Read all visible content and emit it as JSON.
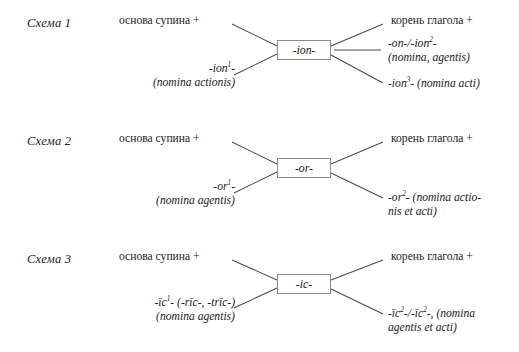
{
  "document": {
    "type": "linguistic-derivation-diagrams",
    "language": "ru",
    "scheme_count": 3
  },
  "schemes": [
    {
      "label": "Схема 1",
      "center_box": "-ion-",
      "top_left": "основа супина +",
      "bottom_left_line1": "-ion",
      "bottom_left_sup": "1",
      "bottom_left_line1_tail": "-",
      "bottom_left_line2": "(nomina actionis)",
      "top_right": "корень глагола +",
      "mid_right_line1_a": "-on-/-ion",
      "mid_right_sup": "2",
      "mid_right_line1_tail": "-",
      "mid_right_line2": "(nomina, agentis)",
      "bottom_right_a": "-ion",
      "bottom_right_sup": "3",
      "bottom_right_tail": "- (nomina acti)"
    },
    {
      "label": "Схема 2",
      "center_box": "-or-",
      "top_left": "основа супина +",
      "bottom_left_line1": "-or",
      "bottom_left_sup": "1",
      "bottom_left_line1_tail": "-",
      "bottom_left_line2": "(nomina agentis)",
      "top_right": "корень глагола +",
      "bottom_right_a": "-or",
      "bottom_right_sup": "2",
      "bottom_right_tail": "- (nomina actio-",
      "bottom_right_line2": "nis et acti)"
    },
    {
      "label": "Схема 3",
      "center_box": "-ic-",
      "top_left": "основа супина +",
      "bottom_left_line1": "-īc",
      "bottom_left_sup": "1",
      "bottom_left_line1_tail": "- (-rīc-, -trīc-)",
      "bottom_left_line2": "(nomina agentis)",
      "top_right": "корень глагола +",
      "bottom_right_a": "-īc",
      "bottom_right_sup": "2",
      "bottom_right_mid": "-/-īc",
      "bottom_right_sup2": "2",
      "bottom_right_tail": "-, (nomina",
      "bottom_right_line2": "agentis et acti)"
    }
  ],
  "colors": {
    "text": "#1a1a1a",
    "line": "#4a4a4a",
    "box_border": "#8a8a8a",
    "background": "#ffffff"
  }
}
